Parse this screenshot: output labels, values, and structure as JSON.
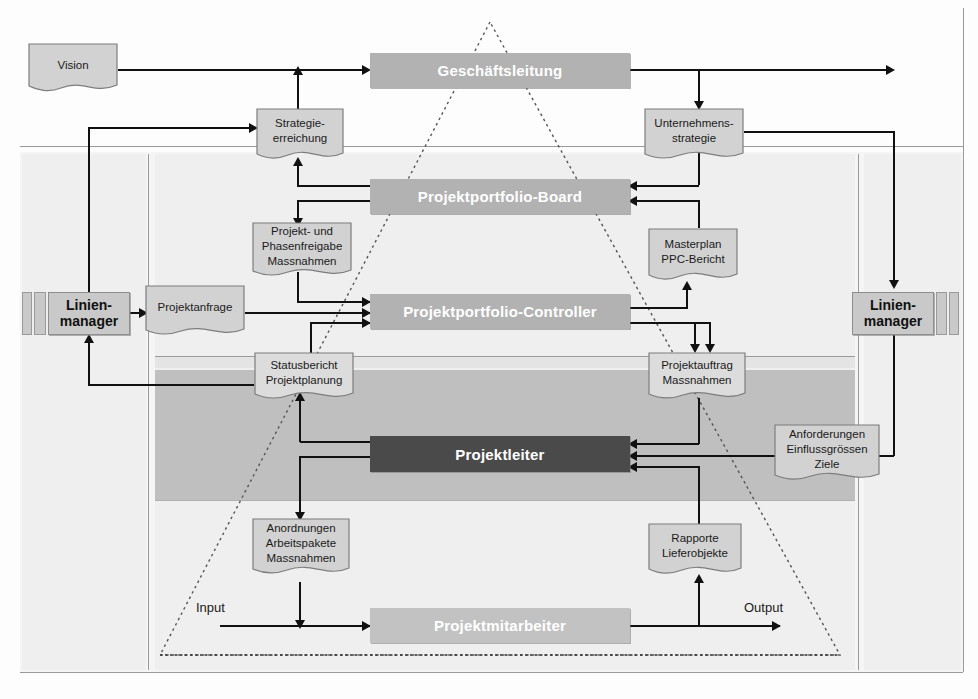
{
  "diagram": {
    "roles": [
      {
        "id": "geschaeftsleitung",
        "label": "Geschäftsleitung",
        "color": "#b2b2b2"
      },
      {
        "id": "projektportfolio_board",
        "label": "Projektportfolio-Board",
        "color": "#b2b2b2"
      },
      {
        "id": "projektportfolio_controller",
        "label": "Projektportfolio-Controller",
        "color": "#b2b2b2"
      },
      {
        "id": "projektleiter",
        "label": "Projektleiter",
        "color": "#4a4a4a"
      },
      {
        "id": "projektmitarbeiter",
        "label": "Projektmitarbeiter",
        "color": "#c2c2c2"
      }
    ],
    "managers": [
      {
        "id": "linienmanager_links",
        "line1": "Linien-",
        "line2": "manager"
      },
      {
        "id": "linienmanager_rechts",
        "line1": "Linien-",
        "line2": "manager"
      }
    ],
    "documents": [
      {
        "id": "vision",
        "lines": [
          "Vision"
        ]
      },
      {
        "id": "strategieerreichung",
        "lines": [
          "Strategie-",
          "erreichung"
        ]
      },
      {
        "id": "unternehmensstrategie",
        "lines": [
          "Unternehmens-",
          "strategie"
        ]
      },
      {
        "id": "projekt_phasenfreigabe",
        "lines": [
          "Projekt- und",
          "Phasenfreigabe",
          "Massnahmen"
        ]
      },
      {
        "id": "masterplan_ppc",
        "lines": [
          "Masterplan",
          "PPC-Bericht"
        ]
      },
      {
        "id": "projektanfrage",
        "lines": [
          "Projektanfrage"
        ]
      },
      {
        "id": "statusbericht",
        "lines": [
          "Statusbericht",
          "Projektplanung"
        ]
      },
      {
        "id": "projektauftrag",
        "lines": [
          "Projektauftrag",
          "Massnahmen"
        ]
      },
      {
        "id": "anforderungen",
        "lines": [
          "Anforderungen",
          "Einflussgrössen",
          "Ziele"
        ]
      },
      {
        "id": "anordnungen",
        "lines": [
          "Anordnungen",
          "Arbeitspakete",
          "Massnahmen"
        ]
      },
      {
        "id": "rapporte",
        "lines": [
          "Rapporte",
          "Lieferobjekte"
        ]
      }
    ],
    "io_labels": {
      "input": "Input",
      "output": "Output"
    },
    "colors": {
      "role_grey": "#b2b2b2",
      "role_light": "#c2c2c2",
      "role_dark": "#4a4a4a",
      "manager_fill": "#c9c9c9",
      "doc_fill": "#d2d2d2",
      "band_light": "#efefef",
      "band_mid": "#e4e4e4",
      "band_dark": "#bfbfbf",
      "line": "#111111"
    }
  }
}
